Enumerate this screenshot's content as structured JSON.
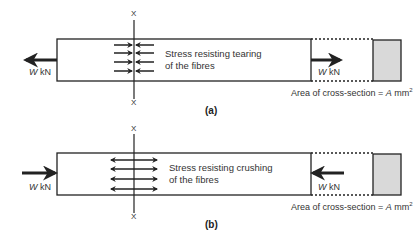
{
  "diagrams": [
    {
      "id": "a",
      "caption": "(a)",
      "section_label_top": "X",
      "section_label_bottom": "X",
      "stress_line1": "Stress resisting tearing",
      "stress_line2": "of the fibres",
      "load_left": {
        "symbol": "W",
        "unit": "kN",
        "direction": "left"
      },
      "load_right": {
        "symbol": "W",
        "unit": "kN",
        "direction": "right"
      },
      "area_prefix": "Area of cross-section = ",
      "area_symbol": "A",
      "area_unit": "mm",
      "area_exp": "2",
      "stress_type": "tension"
    },
    {
      "id": "b",
      "caption": "(b)",
      "section_label_top": "X",
      "section_label_bottom": "X",
      "stress_line1": "Stress resisting crushing",
      "stress_line2": "of the fibres",
      "load_left": {
        "symbol": "W",
        "unit": "kN",
        "direction": "right"
      },
      "load_right": {
        "symbol": "W",
        "unit": "kN",
        "direction": "left"
      },
      "area_prefix": "Area of cross-section = ",
      "area_symbol": "A",
      "area_unit": "mm",
      "area_exp": "2",
      "stress_type": "compression"
    }
  ],
  "colors": {
    "line": "#222222",
    "cross_section_fill": "#d9d9d9"
  }
}
